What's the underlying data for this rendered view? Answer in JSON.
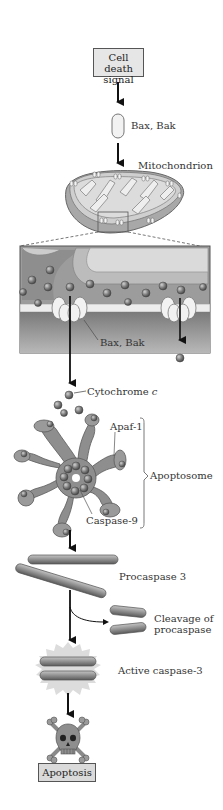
{
  "figure": {
    "steps": {
      "signal": "Cell death\nsignal",
      "signal_line1": "Cell death",
      "signal_line2": "signal",
      "bax_bak_top": "Bax, Bak",
      "mitochondrion": "Mitochondrion",
      "bax_bak_inset": "Bax, Bak",
      "cytochrome_prefix": "Cytochrome ",
      "cytochrome_italic": "c",
      "apaf1": "Apaf-1",
      "caspase9": "Caspase-9",
      "apoptosome": "Apoptosome",
      "procaspase3": "Procaspase 3",
      "cleavage_line1": "Cleavage of",
      "cleavage_line2": "procaspase",
      "active_caspase3": "Active caspase-3",
      "apoptosis": "Apoptosis"
    },
    "icons": [
      "arrow-down-icon",
      "mitochondrion-icon",
      "membrane-inset",
      "apoptosome-icon",
      "procaspase-rod-icon",
      "starburst-icon",
      "skull-crossbones-icon"
    ],
    "colors": {
      "box_fill": "#e6e6e6",
      "protein_gray": "#8a8a8a",
      "membrane_fill": "#bdbdbd",
      "inset_bg": "#9e9e9e",
      "text": "#333333"
    }
  }
}
